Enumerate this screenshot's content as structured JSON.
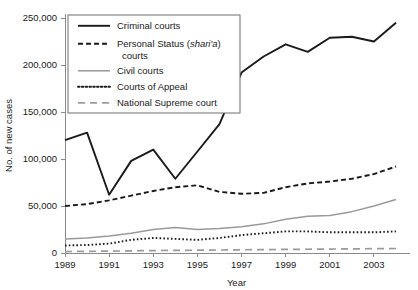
{
  "chart_data": {
    "type": "line",
    "title": "",
    "xlabel": "Year",
    "ylabel": "No. of new cases",
    "xlim": [
      1989,
      2004
    ],
    "ylim": [
      0,
      250000
    ],
    "yticks": [
      0,
      50000,
      100000,
      150000,
      200000,
      250000
    ],
    "ytick_labels": [
      "0",
      "50,000",
      "100,000",
      "150,000",
      "200,000",
      "250,000"
    ],
    "xticks": [
      1989,
      1991,
      1993,
      1995,
      1997,
      1999,
      2001,
      2003
    ],
    "xtick_labels": [
      "1989",
      "1991",
      "1993",
      "1995",
      "1997",
      "1999",
      "2001",
      "2003"
    ],
    "x": [
      1989,
      1990,
      1991,
      1992,
      1993,
      1994,
      1995,
      1996,
      1997,
      1998,
      1999,
      2000,
      2001,
      2002,
      2003,
      2004
    ],
    "grid": false,
    "legend_position": "upper-left",
    "series": [
      {
        "name": "Criminal courts",
        "style": "solid",
        "color": "#1a1a1a",
        "width": 1.9,
        "values": [
          120000,
          128000,
          62000,
          98000,
          110000,
          79000,
          108000,
          137000,
          192000,
          209000,
          222000,
          214000,
          229000,
          230000,
          225000,
          245000
        ]
      },
      {
        "name": "Personal Status (shari'a) courts",
        "style": "dashed",
        "color": "#1a1a1a",
        "width": 1.9,
        "values": [
          50000,
          52000,
          56000,
          61000,
          66000,
          70000,
          72000,
          65000,
          63000,
          64000,
          70000,
          74000,
          76000,
          79000,
          84000,
          92000
        ]
      },
      {
        "name": "Civil courts",
        "style": "solid",
        "color": "#9a9a9a",
        "width": 1.5,
        "values": [
          15000,
          16000,
          18000,
          21000,
          25000,
          27000,
          25000,
          26000,
          28000,
          31000,
          36000,
          39000,
          40000,
          44000,
          50000,
          57000
        ]
      },
      {
        "name": "Courts of Appeal",
        "style": "dotted",
        "color": "#1a1a1a",
        "width": 1.9,
        "values": [
          8000,
          8500,
          10000,
          14000,
          16000,
          15000,
          14000,
          16000,
          19000,
          21000,
          23000,
          23000,
          22000,
          22000,
          22000,
          23000
        ]
      },
      {
        "name": "National Supreme court",
        "style": "longdash",
        "color": "#9a9a9a",
        "width": 1.7,
        "values": [
          1500,
          1800,
          2000,
          2300,
          2600,
          2800,
          3000,
          3200,
          3400,
          3600,
          3800,
          4000,
          4200,
          4400,
          4600,
          4800
        ]
      }
    ]
  },
  "legend": {
    "entries": [
      {
        "label": "Criminal courts",
        "label2": ""
      },
      {
        "label": "Personal Status (shari'a)",
        "label2": "courts"
      },
      {
        "label": "Civil courts",
        "label2": ""
      },
      {
        "label": "Courts of Appeal",
        "label2": ""
      },
      {
        "label": "National Supreme court",
        "label2": ""
      }
    ]
  },
  "colors": {
    "dark": "#1a1a1a",
    "grey": "#9a9a9a",
    "axis": "#8a8a8a",
    "background": "#ffffff"
  }
}
